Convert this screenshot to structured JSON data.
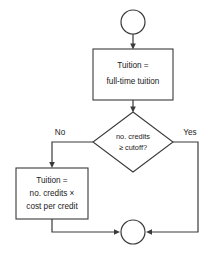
{
  "diagram": {
    "type": "flowchart",
    "colors": {
      "stroke": "#3a3a3a",
      "text": "#1a1a1a",
      "background": "#ffffff"
    },
    "nodes": {
      "start_connector": {
        "shape": "circle",
        "label": ""
      },
      "full_time_process": {
        "shape": "rectangle",
        "line1": "Tuition =",
        "line2": "full-time tuition"
      },
      "decision": {
        "shape": "diamond",
        "line1": "no. credits",
        "line2": "≥ cutoff?"
      },
      "per_credit_process": {
        "shape": "rectangle",
        "line1": "Tuition =",
        "line2": "no. credits ×",
        "line3": "cost per credit"
      },
      "end_connector": {
        "shape": "circle",
        "label": ""
      }
    },
    "branches": {
      "no_label": "No",
      "yes_label": "Yes"
    }
  }
}
